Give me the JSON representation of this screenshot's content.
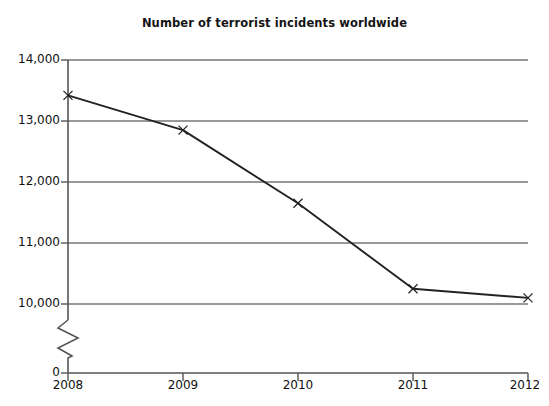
{
  "chart_data": {
    "type": "line",
    "title": "Number of terrorist incidents worldwide",
    "xlabel": "",
    "ylabel": "",
    "categories": [
      "2008",
      "2009",
      "2010",
      "2011",
      "2012"
    ],
    "values": [
      13420,
      12850,
      11650,
      10250,
      10100
    ],
    "series": [
      {
        "name": "Number of terrorist incidents worldwide",
        "values": [
          13420,
          12850,
          11650,
          10250,
          10100
        ]
      }
    ],
    "x": [
      2008,
      2009,
      2010,
      2011,
      2012
    ],
    "ylim": [
      10000,
      14000
    ],
    "y_axis_break": true,
    "y_axis_break_note": "zigzag break between 0 and 10,000",
    "yticks": [
      0,
      10000,
      11000,
      12000,
      13000,
      14000
    ],
    "ytick_labels": [
      "0",
      "10,000",
      "11,000",
      "12,000",
      "13,000",
      "14,000"
    ],
    "xtick_labels": [
      "2008",
      "2009",
      "2010",
      "2011",
      "2012"
    ],
    "grid": true,
    "grid_axis": "y",
    "legend": false,
    "legend_position": "none",
    "marker": "x",
    "line_color": "#222222",
    "grid_color": "#777777",
    "axis_color": "#555555",
    "background_color": "#ffffff"
  },
  "axes": {
    "y_labels": [
      {
        "text": "14,000",
        "value": 14000
      },
      {
        "text": "13,000",
        "value": 13000
      },
      {
        "text": "12,000",
        "value": 12000
      },
      {
        "text": "11,000",
        "value": 11000
      },
      {
        "text": "10,000",
        "value": 10000
      },
      {
        "text": "0",
        "value": 0
      }
    ],
    "x_labels": [
      {
        "text": "2008"
      },
      {
        "text": "2009"
      },
      {
        "text": "2010"
      },
      {
        "text": "2011"
      },
      {
        "text": "2012"
      }
    ]
  },
  "icons": {
    "marker": "x-marker-icon",
    "axis_break": "axis-break-zigzag-icon"
  }
}
